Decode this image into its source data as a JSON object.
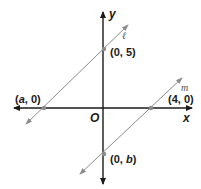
{
  "diagram": {
    "axes": {
      "x_label": "x",
      "y_label": "y",
      "origin_label": "O"
    },
    "lines": [
      {
        "name": "ℓ",
        "points": [
          {
            "label_prefix": "(",
            "x": "0",
            "sep": ", ",
            "y": "5",
            "label_suffix": ")"
          },
          {
            "label_prefix": "(",
            "x": "a",
            "sep": ", ",
            "y": "0",
            "label_suffix": ")"
          }
        ]
      },
      {
        "name": "m",
        "points": [
          {
            "label_prefix": "(",
            "x": "4",
            "sep": ", ",
            "y": "0",
            "label_suffix": ")"
          },
          {
            "label_prefix": "(",
            "x": "0",
            "sep": ", ",
            "y": "b",
            "label_suffix": ")"
          }
        ]
      }
    ],
    "colors": {
      "axis": "#1a1a1a",
      "line": "#8c8c8c",
      "point": "#8c8c8c"
    }
  }
}
